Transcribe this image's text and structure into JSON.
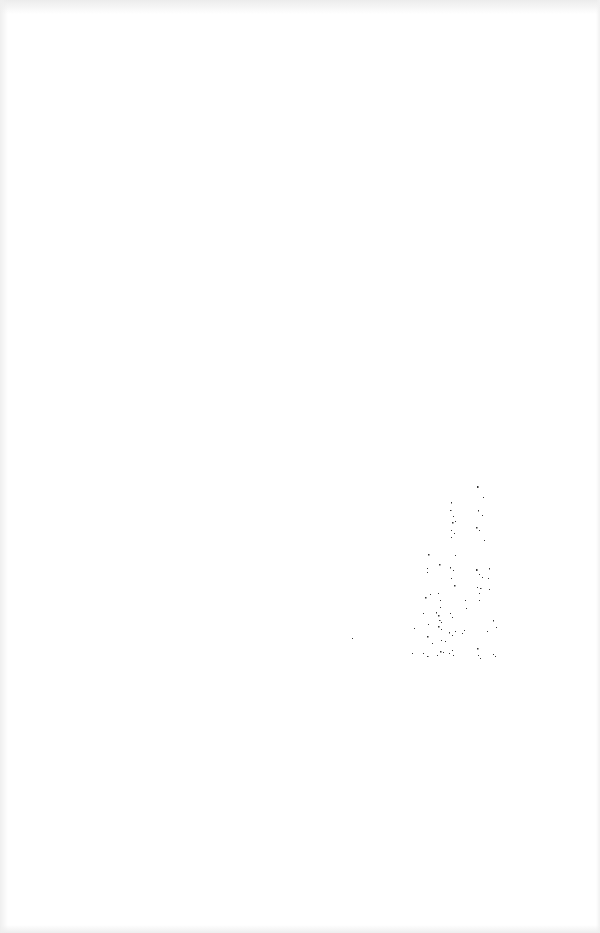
{
  "page": {
    "type": "blank scanned page",
    "background_color": "#ffffff",
    "text_content": "",
    "speckle_color": "#333333",
    "speckle_region": {
      "x": 410,
      "y": 480,
      "width": 95,
      "height": 185
    }
  }
}
